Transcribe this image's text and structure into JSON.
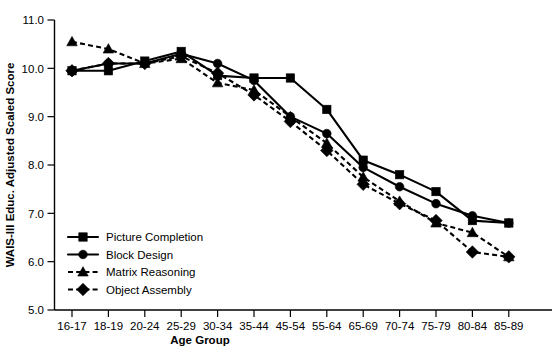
{
  "chart_data": {
    "type": "line",
    "title": "",
    "xlabel": "Age Group",
    "ylabel": "WAIS-III Educ. Adjusted Scaled Score",
    "categories": [
      "16-17",
      "18-19",
      "20-24",
      "25-29",
      "30-34",
      "35-44",
      "45-54",
      "55-64",
      "65-69",
      "70-74",
      "75-79",
      "80-84",
      "85-89"
    ],
    "ylim": [
      5.0,
      11.0
    ],
    "ytick_labels": [
      "5.0",
      "6.0",
      "7.0",
      "8.0",
      "9.0",
      "10.0",
      "11.0"
    ],
    "ytick_values": [
      5.0,
      6.0,
      7.0,
      8.0,
      9.0,
      10.0,
      11.0
    ],
    "grid": false,
    "legend_position": "lower-left-inside",
    "series": [
      {
        "name": "Picture Completion",
        "marker": "square",
        "linestyle": "solid",
        "values": [
          9.95,
          9.95,
          10.15,
          10.35,
          9.85,
          9.8,
          9.8,
          9.15,
          8.1,
          7.8,
          7.45,
          6.85,
          6.8
        ]
      },
      {
        "name": "Block Design",
        "marker": "circle",
        "linestyle": "solid",
        "values": [
          9.95,
          10.1,
          10.1,
          10.3,
          10.1,
          9.75,
          9.0,
          8.65,
          7.95,
          7.55,
          7.2,
          6.95,
          6.8
        ]
      },
      {
        "name": "Matrix Reasoning",
        "marker": "triangle",
        "linestyle": "dashed",
        "values": [
          10.55,
          10.4,
          10.1,
          10.2,
          9.7,
          9.55,
          9.0,
          8.45,
          7.75,
          7.25,
          6.8,
          6.6,
          6.1
        ]
      },
      {
        "name": "Object Assembly",
        "marker": "diamond",
        "linestyle": "dashed",
        "values": [
          9.95,
          10.1,
          10.1,
          10.25,
          9.9,
          9.45,
          8.9,
          8.3,
          7.6,
          7.2,
          6.85,
          6.2,
          6.1
        ]
      }
    ]
  },
  "colors": {
    "foreground": "#000000",
    "background": "#ffffff"
  }
}
